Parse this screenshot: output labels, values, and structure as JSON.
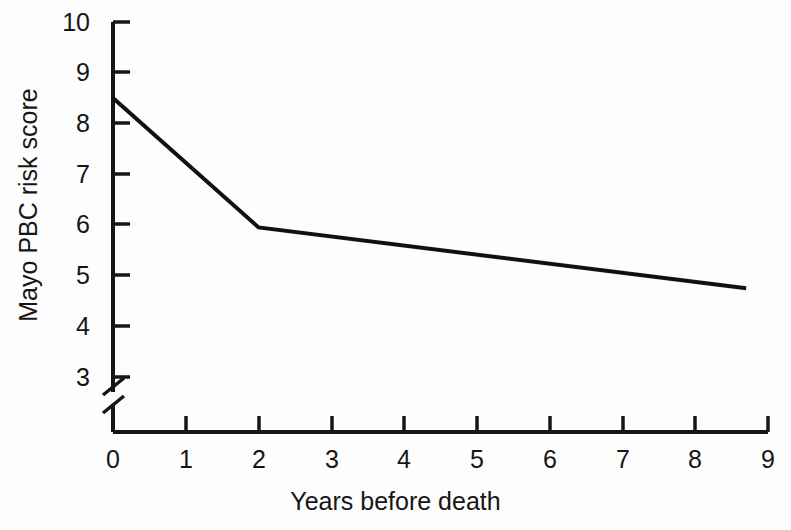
{
  "figure": {
    "background_color": "#fdfdfd",
    "ink_color": "#161616"
  },
  "chart_data": {
    "type": "line",
    "title": "",
    "subtitle": "",
    "xlabel": "Years before death",
    "ylabel": "Mayo PBC risk score",
    "xlim": [
      0,
      9
    ],
    "ylim": [
      3,
      10
    ],
    "y_axis_break": true,
    "y_axis_break_note": "axis broken below 3",
    "grid": false,
    "legend": null,
    "xticks": [
      0,
      1,
      2,
      3,
      4,
      5,
      6,
      7,
      8,
      9
    ],
    "xtick_labels": [
      "0",
      "1",
      "2",
      "3",
      "4",
      "5",
      "6",
      "7",
      "8",
      "9"
    ],
    "yticks": [
      3,
      4,
      5,
      6,
      7,
      8,
      9,
      10
    ],
    "ytick_labels": [
      "3",
      "4",
      "5",
      "6",
      "7",
      "8",
      "9",
      "10"
    ],
    "series": [
      {
        "name": "Mayo PBC risk score",
        "color": "#111111",
        "line_width": 4,
        "x": [
          0,
          2,
          8.7
        ],
        "values": [
          8.5,
          5.95,
          4.75
        ]
      }
    ],
    "annotations": []
  }
}
